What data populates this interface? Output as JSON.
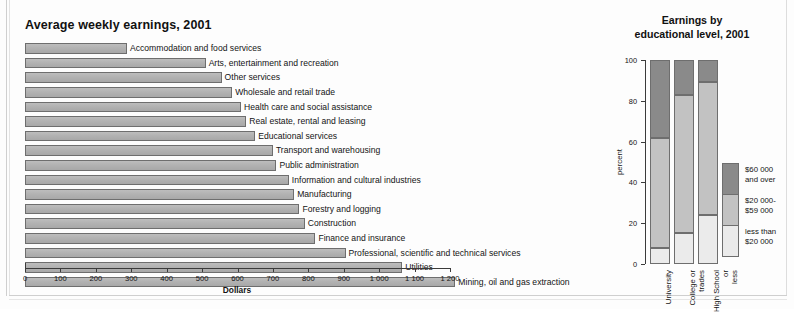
{
  "bar_chart": {
    "title": "Average weekly earnings, 2001",
    "axis_label": "Dollars",
    "ticks": [
      "0",
      "100",
      "200",
      "300",
      "400",
      "500",
      "600",
      "700",
      "800",
      "900",
      "1 000",
      "1 100",
      "1 200"
    ]
  },
  "column_chart": {
    "title_line1": "Earnings by",
    "title_line2": "educational level, 2001",
    "ylabel": "percent",
    "yticks": [
      "0",
      "20",
      "40",
      "60",
      "80",
      "100"
    ],
    "legend": [
      {
        "label_line1": "$60 000",
        "label_line2": "and over",
        "color": "#8a8a8a"
      },
      {
        "label_line1": "$20 000-",
        "label_line2": "$59 000",
        "color": "#c2c2c2"
      },
      {
        "label_line1": "less than",
        "label_line2": "$20 000",
        "color": "#ebebeb"
      }
    ]
  },
  "chart_data": [
    {
      "type": "bar",
      "orientation": "horizontal",
      "title": "Average weekly earnings, 2001",
      "xlabel": "Dollars",
      "ylabel": "",
      "xlim": [
        0,
        1200
      ],
      "grid": false,
      "legend": "none",
      "categories": [
        "Accommodation and food services",
        "Arts, entertainment and recreation",
        "Other services",
        "Wholesale and retail trade",
        "Health care and social assistance",
        "Real estate, rental and leasing",
        "Educational services",
        "Transport and warehousing",
        "Public administration",
        "Information and cultural industries",
        "Manufacturing",
        "Forestry and logging",
        "Construction",
        "Finance and insurance",
        "Professional, scientific and technical services",
        "Utilities",
        "Mining, oil and gas extraction"
      ],
      "values": [
        288,
        510,
        555,
        585,
        610,
        625,
        650,
        700,
        710,
        745,
        760,
        775,
        790,
        820,
        905,
        1065,
        1215
      ],
      "tick_labels": [
        "0",
        "100",
        "200",
        "300",
        "400",
        "500",
        "600",
        "700",
        "800",
        "900",
        "1 000",
        "1 100",
        "1 200"
      ]
    },
    {
      "type": "bar",
      "subtype": "stacked-column",
      "title": "Earnings by educational level, 2001",
      "xlabel": "",
      "ylabel": "percent",
      "ylim": [
        0,
        100
      ],
      "grid": false,
      "legend": "right",
      "categories": [
        "University",
        "College or trades",
        "High School or less"
      ],
      "series": [
        {
          "name": "less than $20 000",
          "values": [
            8,
            15,
            24
          ],
          "color": "#ebebeb"
        },
        {
          "name": "$20 000-$59 000",
          "values": [
            54,
            68,
            65
          ],
          "color": "#c2c2c2"
        },
        {
          "name": "$60 000 and over",
          "values": [
            38,
            17,
            11
          ],
          "color": "#8a8a8a"
        }
      ],
      "tick_labels": [
        "0",
        "20",
        "40",
        "60",
        "80",
        "100"
      ]
    }
  ]
}
